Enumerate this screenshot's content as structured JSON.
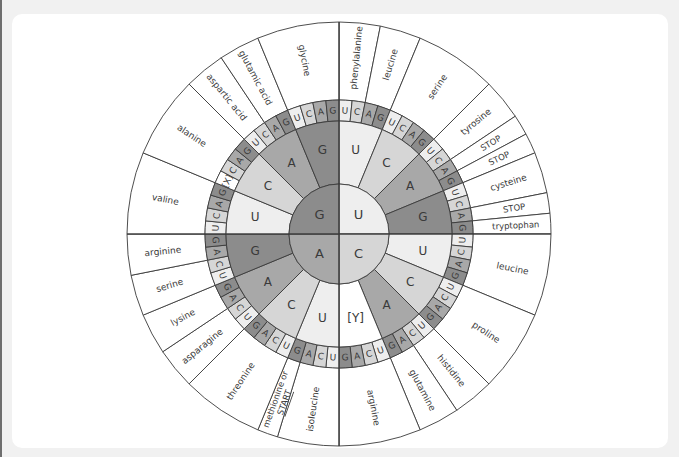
{
  "diagram": {
    "center": {
      "x": 339,
      "y": 234
    },
    "radii": {
      "inner": 50,
      "ring2": 113,
      "ring3": 134,
      "outer": 212
    },
    "colors": {
      "G": "#8c8c8c",
      "A": "#a8a8a8",
      "C": "#d6d6d6",
      "U": "#eeeeee",
      "blank": "#ffffff",
      "line": "#3a3a3a",
      "text": "#3a3a3a"
    },
    "base_order": [
      "U",
      "C",
      "A",
      "G"
    ],
    "ring1": [
      {
        "label": "U",
        "color_key": "U"
      },
      {
        "label": "C",
        "color_key": "C"
      },
      {
        "label": "A",
        "color_key": "A"
      },
      {
        "label": "G",
        "color_key": "G"
      }
    ],
    "ring2": [
      {
        "label": "U",
        "color_key": "U"
      },
      {
        "label": "C",
        "color_key": "C"
      },
      {
        "label": "A",
        "color_key": "A"
      },
      {
        "label": "G",
        "color_key": "G"
      },
      {
        "label": "U",
        "color_key": "U"
      },
      {
        "label": "C",
        "color_key": "C"
      },
      {
        "label": "A",
        "color_key": "A"
      },
      {
        "label": "[Y]",
        "color_key": "blank"
      },
      {
        "label": "U",
        "color_key": "U"
      },
      {
        "label": "C",
        "color_key": "C"
      },
      {
        "label": "A",
        "color_key": "A"
      },
      {
        "label": "G",
        "color_key": "G"
      },
      {
        "label": "U",
        "color_key": "U"
      },
      {
        "label": "C",
        "color_key": "C"
      },
      {
        "label": "A",
        "color_key": "A"
      },
      {
        "label": "G",
        "color_key": "G"
      }
    ],
    "ring3_overrides": [
      {
        "index": 52,
        "label": "[X]",
        "color_key": "blank"
      }
    ],
    "amino_acids": [
      {
        "name": "phenylalanine",
        "start": 0,
        "end": 2
      },
      {
        "name": "leucine",
        "start": 2,
        "end": 4
      },
      {
        "name": "serine",
        "start": 4,
        "end": 8
      },
      {
        "name": "tyrosine",
        "start": 8,
        "end": 10
      },
      {
        "name": "STOP",
        "start": 10,
        "end": 11
      },
      {
        "name": "STOP",
        "start": 11,
        "end": 12
      },
      {
        "name": "cysteine",
        "start": 12,
        "end": 14
      },
      {
        "name": "STOP",
        "start": 14,
        "end": 15
      },
      {
        "name": "tryptophan",
        "start": 15,
        "end": 16
      },
      {
        "name": "leucine",
        "start": 16,
        "end": 20
      },
      {
        "name": "proline",
        "start": 20,
        "end": 24
      },
      {
        "name": "histidine",
        "start": 24,
        "end": 26
      },
      {
        "name": "glutamine",
        "start": 26,
        "end": 28
      },
      {
        "name": "arginine",
        "start": 28,
        "end": 32
      },
      {
        "name": "isoleucine",
        "start": 32,
        "end": 35
      },
      {
        "name": "methionine or START",
        "lines": [
          "methionine or",
          "START"
        ],
        "start": 35,
        "end": 36
      },
      {
        "name": "threonine",
        "start": 36,
        "end": 40
      },
      {
        "name": "asparagine",
        "start": 40,
        "end": 42
      },
      {
        "name": "lysine",
        "start": 42,
        "end": 44
      },
      {
        "name": "serine",
        "start": 44,
        "end": 46
      },
      {
        "name": "arginine",
        "start": 46,
        "end": 48
      },
      {
        "name": "valine",
        "start": 48,
        "end": 52
      },
      {
        "name": "alanine",
        "start": 52,
        "end": 56
      },
      {
        "name": "aspartic acid",
        "start": 56,
        "end": 58
      },
      {
        "name": "glutamic acid",
        "start": 58,
        "end": 60
      },
      {
        "name": "glycine",
        "start": 60,
        "end": 64
      }
    ]
  }
}
